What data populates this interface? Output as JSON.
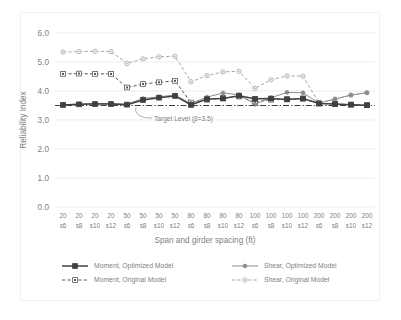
{
  "chart_data": {
    "type": "line",
    "title": "",
    "xlabel": "Span and girder spacing (ft)",
    "ylabel": "Reliability Index",
    "ylim": [
      0.0,
      6.0
    ],
    "ytick_step": 1.0,
    "ytick_labels": [
      "6.0",
      "5.0",
      "4.0",
      "3.0",
      "2.0",
      "1.0",
      "0.0"
    ],
    "ytick_values": [
      6.0,
      5.0,
      4.0,
      3.0,
      2.0,
      1.0,
      0.0
    ],
    "grid": "horizontal",
    "legend_position": "bottom",
    "categories": [
      "20 s6",
      "20 s8",
      "20 s10",
      "20 s12",
      "50 s6",
      "50 s8",
      "50 s10",
      "50 s12",
      "80 s6",
      "80 s8",
      "80 s10",
      "80 s12",
      "100 s6",
      "100 s8",
      "100 s10",
      "100 s12",
      "200 s6",
      "200 s8",
      "200 s10",
      "200 s12"
    ],
    "category_span_row": [
      "20",
      "20",
      "20",
      "20",
      "50",
      "50",
      "50",
      "50",
      "80",
      "80",
      "80",
      "80",
      "100",
      "100",
      "100",
      "100",
      "200",
      "200",
      "200",
      "200"
    ],
    "category_spacing_row": [
      "s6",
      "s8",
      "s10",
      "s12",
      "s6",
      "s8",
      "s10",
      "s12",
      "s6",
      "s8",
      "s10",
      "s12",
      "s6",
      "s8",
      "s10",
      "s12",
      "s6",
      "s8",
      "s10",
      "s12"
    ],
    "series": [
      {
        "name": "Moment, Optimized Model",
        "style": "solid",
        "color": "#404040",
        "marker": "filled-square",
        "values": [
          3.52,
          3.54,
          3.55,
          3.55,
          3.53,
          3.69,
          3.77,
          3.83,
          3.52,
          3.72,
          3.74,
          3.84,
          3.73,
          3.74,
          3.71,
          3.74,
          3.57,
          3.55,
          3.53,
          3.51
        ]
      },
      {
        "name": "Shear, Optimized Model",
        "style": "solid",
        "color": "#8c8c8c",
        "marker": "filled-dot",
        "values": [
          3.52,
          3.55,
          3.57,
          3.57,
          3.55,
          3.74,
          3.8,
          3.86,
          3.57,
          3.79,
          3.93,
          3.87,
          3.54,
          3.77,
          3.95,
          3.94,
          3.58,
          3.72,
          3.86,
          3.94
        ]
      },
      {
        "name": "Moment, Original Model",
        "style": "dashed",
        "color": "#595959",
        "marker": "hollow-square",
        "values": [
          4.59,
          4.6,
          4.59,
          4.59,
          4.12,
          4.24,
          4.3,
          4.35,
          3.6,
          3.7,
          3.76,
          3.81,
          3.62,
          3.7,
          3.72,
          3.74,
          3.57,
          3.55,
          3.53,
          3.51
        ]
      },
      {
        "name": "Shear, Original Model",
        "style": "dashed",
        "color": "#a6a6a6",
        "marker": "hollow-circle",
        "values": [
          5.34,
          5.36,
          5.37,
          5.36,
          4.95,
          5.11,
          5.18,
          5.2,
          4.32,
          4.53,
          4.66,
          4.68,
          4.09,
          4.39,
          4.52,
          4.51,
          3.59,
          3.72,
          3.86,
          3.94
        ]
      }
    ],
    "reference_line": {
      "label": "Target Level (β=3.5)",
      "value": 3.5,
      "style": "dash-dot",
      "color": "#3f3f3f"
    },
    "annotations": [
      {
        "text": "Target Level (β=3.5)",
        "value": 3.5
      }
    ]
  },
  "legend": {
    "items": [
      {
        "label": "Moment, Optimized Model"
      },
      {
        "label": "Moment, Original Model"
      },
      {
        "label": "Shear, Optimized Model"
      },
      {
        "label": "Shear, Original Model"
      }
    ]
  }
}
